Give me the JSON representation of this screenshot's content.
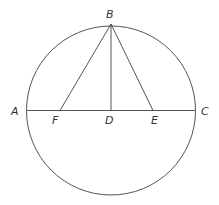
{
  "diagram": {
    "stroke_color": "#555555",
    "circle": {
      "cx": 111,
      "cy": 110.5,
      "r": 84.5
    },
    "points": {
      "A": {
        "label": "A",
        "x": 27,
        "y": 110.5
      },
      "B": {
        "label": "B",
        "x": 111,
        "y": 24
      },
      "C": {
        "label": "C",
        "x": 195,
        "y": 110.5
      },
      "D": {
        "label": "D",
        "x": 111,
        "y": 110.5
      },
      "E": {
        "label": "E",
        "x": 153,
        "y": 110.5
      },
      "F": {
        "label": "F",
        "x": 60,
        "y": 110.5
      }
    },
    "segments": [
      [
        "A",
        "C"
      ],
      [
        "B",
        "D"
      ],
      [
        "B",
        "F"
      ],
      [
        "B",
        "E"
      ]
    ],
    "labels": {
      "A": "A",
      "B": "B",
      "C": "C",
      "D": "D",
      "E": "E",
      "F": "F"
    }
  }
}
